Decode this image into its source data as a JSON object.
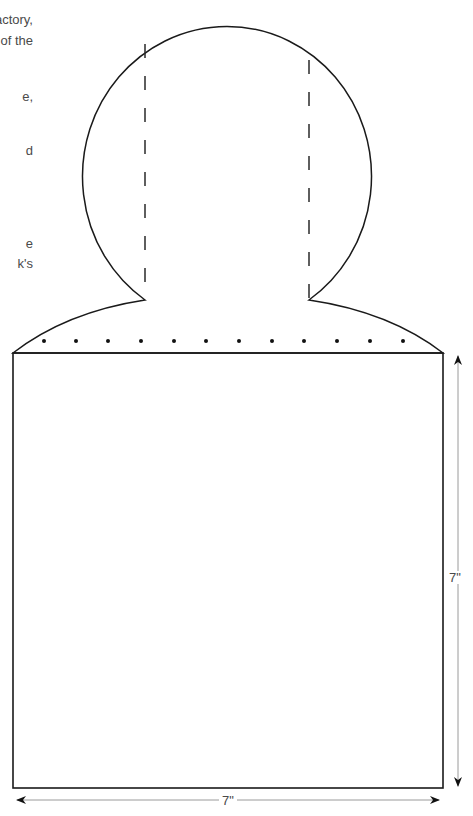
{
  "body_text_fragments": [
    {
      "text": "actory,",
      "right": 440,
      "top": 13
    },
    {
      "text": "s of the",
      "right": 440,
      "top": 34
    },
    {
      "text": "e,",
      "right": 440,
      "top": 90
    },
    {
      "text": "d",
      "right": 440,
      "top": 144
    },
    {
      "text": "e",
      "right": 440,
      "top": 237
    },
    {
      "text": "k's",
      "right": 440,
      "top": 257
    }
  ],
  "pattern": {
    "stroke_color": "#1a1a1a",
    "dash_color": "#2a2a2a",
    "dimension_line_color": "#9a9a9a",
    "dot_count": 12
  },
  "dimensions": {
    "height_label": "7\"",
    "width_label": "7\""
  }
}
